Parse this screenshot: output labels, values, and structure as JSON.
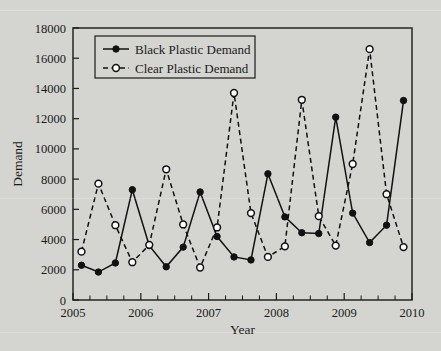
{
  "chart_data": {
    "type": "line",
    "title": "",
    "subtitle": "",
    "xlabel": "Year",
    "ylabel": "Demand",
    "xlim": [
      2005,
      2010
    ],
    "ylim": [
      0,
      18000
    ],
    "xticks": [
      2005,
      2006,
      2007,
      2008,
      2009,
      2010
    ],
    "xtick_labels": [
      "2005",
      "2006",
      "2007",
      "2008",
      "2009",
      "2010"
    ],
    "x_minor_ticks_per_interval": 4,
    "yticks": [
      0,
      2000,
      4000,
      6000,
      8000,
      10000,
      12000,
      14000,
      16000,
      18000
    ],
    "ytick_labels": [
      "0",
      "2000",
      "4000",
      "6000",
      "8000",
      "10000",
      "12000",
      "14000",
      "16000",
      "18000"
    ],
    "grid": false,
    "legend_position": "upper-left",
    "x": [
      2005.125,
      2005.375,
      2005.625,
      2005.875,
      2006.125,
      2006.375,
      2006.625,
      2006.875,
      2007.125,
      2007.375,
      2007.625,
      2007.875,
      2008.125,
      2008.375,
      2008.625,
      2008.875,
      2009.125,
      2009.375,
      2009.625,
      2009.875
    ],
    "series": [
      {
        "name": "Black Plastic Demand",
        "marker": "filled-circle",
        "linestyle": "solid",
        "color": "#111111",
        "values": [
          2300,
          1850,
          2450,
          7300,
          3600,
          2200,
          3500,
          7150,
          4200,
          2850,
          2650,
          8350,
          5500,
          4450,
          4400,
          12100,
          5750,
          3800,
          4950,
          13200
        ]
      },
      {
        "name": "Clear Plastic Demand",
        "marker": "open-circle",
        "linestyle": "dashed",
        "color": "#111111",
        "values": [
          3200,
          7700,
          4950,
          2500,
          3650,
          8650,
          5000,
          2150,
          4800,
          13700,
          5750,
          2850,
          3550,
          13250,
          5550,
          3600,
          9000,
          16600,
          7000,
          3500
        ]
      }
    ]
  },
  "legend": {
    "entries": [
      {
        "label": "Black Plastic Demand",
        "marker": "filled-circle",
        "linestyle": "solid"
      },
      {
        "label": "Clear Plastic Demand",
        "marker": "open-circle",
        "linestyle": "dashed"
      }
    ]
  },
  "colors": {
    "background": "#d4d4d0",
    "plot_background": "#d4d4d0",
    "axis": "#1a1a1a",
    "series": "#111111",
    "marker_fill_open": "#ffffff"
  }
}
